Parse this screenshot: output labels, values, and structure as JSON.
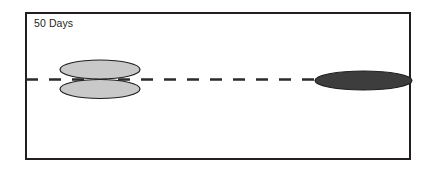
{
  "figure": {
    "name": "droplet-coalescence-50-days",
    "background_color": "#ffffff",
    "width": 431,
    "height": 177
  },
  "panel": {
    "label": "50 Days",
    "label_color": "#231f20",
    "border_color": "#231f20",
    "border_width": 2,
    "fill_color": "#ffffff",
    "x": 25,
    "y": 12,
    "width": 386,
    "height": 148
  },
  "axis": {
    "name": "centerline",
    "style": "dashed",
    "color": "#2b2b2b",
    "y": 79.5,
    "x_start": 26,
    "x_end": 410,
    "dash_length": 12,
    "gap_length": 11,
    "stroke_width": 2.6
  },
  "shapes": [
    {
      "id": "light-ellipse-upper",
      "name": "upper-light-ellipse",
      "fill": "#c9c9c9",
      "stroke": "#231f20",
      "stroke_width": 1.2,
      "cx": 100,
      "cy": 69.5,
      "rx": 40,
      "ry": 9.5
    },
    {
      "id": "light-ellipse-lower",
      "name": "lower-light-ellipse",
      "fill": "#c9c9c9",
      "stroke": "#231f20",
      "stroke_width": 1.2,
      "cx": 100,
      "cy": 89,
      "rx": 40,
      "ry": 9.5
    },
    {
      "id": "dark-ellipse",
      "name": "dark-ellipse",
      "fill": "#3d3d3d",
      "stroke": "#231f20",
      "stroke_width": 1.2,
      "cx": 363.5,
      "cy": 80.5,
      "rx": 48.5,
      "ry": 9.5
    }
  ],
  "chart_data": {
    "type": "scatter",
    "title": "50 Days",
    "xlabel": "",
    "ylabel": "",
    "grid": false,
    "legend": "none",
    "annotations": [
      "50 Days"
    ],
    "series": [
      {
        "name": "light-lenticular-pair",
        "color": "#c9c9c9",
        "points": [
          {
            "label": "upper-light-ellipse",
            "x": 100,
            "y": 69.5,
            "width": 80,
            "height": 19
          },
          {
            "label": "lower-light-ellipse",
            "x": 100,
            "y": 89,
            "width": 80,
            "height": 19
          }
        ]
      },
      {
        "name": "dark-flattened-droplet",
        "color": "#3d3d3d",
        "points": [
          {
            "label": "dark-ellipse",
            "x": 363.5,
            "y": 80.5,
            "width": 97,
            "height": 19
          }
        ]
      }
    ],
    "reference_line": {
      "orientation": "horizontal",
      "y": 79.5,
      "style": "dashed",
      "color": "#2b2b2b"
    },
    "xlim": [
      25,
      411
    ],
    "ylim": [
      12,
      160
    ]
  }
}
